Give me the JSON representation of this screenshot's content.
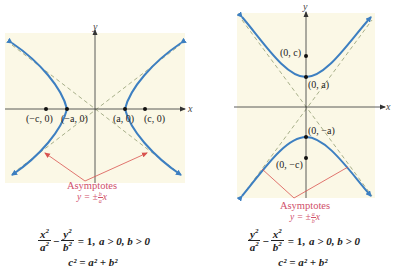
{
  "colors": {
    "background": "#ffffff",
    "panel": "#fbf8e6",
    "curve": "#3d7fc1",
    "asymptote_dashed": "#a8b08a",
    "axis": "#333333",
    "pointer": "#d9534f",
    "asymptote_label": "#d0506a"
  },
  "left_panel": {
    "axis_x_label": "x",
    "axis_y_label": "y",
    "points": [
      {
        "label": "(−c, 0)"
      },
      {
        "label": "(−a, 0)"
      },
      {
        "label": "(a, 0)"
      },
      {
        "label": "(c, 0)"
      }
    ],
    "asymptotes_label": "Asymptotes",
    "asymptote_eq_prefix": "y = ±",
    "asymptote_eq_num": "b",
    "asymptote_eq_den": "a",
    "asymptote_eq_suffix": "x",
    "equation": {
      "term1_num": "x",
      "term1_den": "a",
      "term2_num": "y",
      "term2_den": "b",
      "exp": "2",
      "minus": "−",
      "rhs": "= 1,",
      "conditions": "a > 0, b > 0",
      "relation": "c² = a² + b²"
    }
  },
  "right_panel": {
    "axis_x_label": "x",
    "axis_y_label": "y",
    "points": [
      {
        "label": "(0, c)"
      },
      {
        "label": "(0, a)"
      },
      {
        "label": "(0, −a)"
      },
      {
        "label": "(0, −c)"
      }
    ],
    "asymptotes_label": "Asymptotes",
    "asymptote_eq_prefix": "y = ±",
    "asymptote_eq_num": "a",
    "asymptote_eq_den": "b",
    "asymptote_eq_suffix": "x",
    "equation": {
      "term1_num": "y",
      "term1_den": "a",
      "term2_num": "x",
      "term2_den": "b",
      "exp": "2",
      "minus": "−",
      "rhs": "= 1,",
      "conditions": "a > 0, b > 0",
      "relation": "c² = a² + b²"
    }
  }
}
